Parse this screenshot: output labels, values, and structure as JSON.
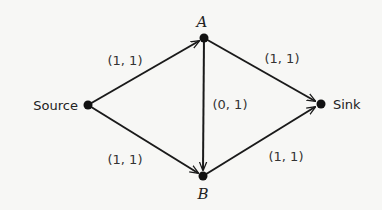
{
  "nodes": {
    "source": {
      "label": "Source",
      "x": 88,
      "y": 105
    },
    "a": {
      "label": "A",
      "x": 204,
      "y": 38
    },
    "b": {
      "label": "B",
      "x": 203,
      "y": 176
    },
    "sink": {
      "label": "Sink",
      "x": 321,
      "y": 104
    }
  },
  "edges": [
    {
      "from": "Source",
      "to": "A",
      "label": "(1, 1)"
    },
    {
      "from": "A",
      "to": "Sink",
      "label": "(1, 1)"
    },
    {
      "from": "A",
      "to": "B",
      "label": "(0, 1)"
    },
    {
      "from": "Source",
      "to": "B",
      "label": "(1, 1)"
    },
    {
      "from": "B",
      "to": "Sink",
      "label": "(1, 1)"
    }
  ],
  "colors": {
    "line": "#1a1a1a",
    "text": "#333333",
    "background": "#f7f7f5"
  }
}
